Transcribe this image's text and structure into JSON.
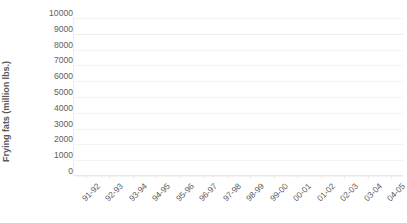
{
  "chart_data": {
    "type": "line",
    "title": "",
    "xlabel": "",
    "ylabel": "Frying fats (million lbs.)",
    "categories": [
      "91-92",
      "92-93",
      "93-94",
      "94-95",
      "95-96",
      "96-97",
      "97-98",
      "98-99",
      "99-00",
      "00-01",
      "01-02",
      "02-03",
      "03-04",
      "04-05"
    ],
    "series": [
      {
        "name": "Frying fats",
        "values": [
          null,
          null,
          null,
          null,
          null,
          null,
          null,
          null,
          null,
          null,
          null,
          null,
          null,
          null
        ]
      }
    ],
    "yticks": [
      10000,
      9000,
      8000,
      7000,
      6000,
      5000,
      4000,
      3000,
      2000,
      1000,
      0
    ],
    "ytick_labels": [
      "10000",
      "9000",
      "8000",
      "7000",
      "6000",
      "5000",
      "4000",
      "3000",
      "2000",
      "1000",
      "0"
    ],
    "ylim": [
      0,
      10000
    ],
    "grid": "faint-horizontal",
    "legend": "none",
    "plot_empty": true,
    "colors": {
      "background": "#ffffff",
      "tick_text": "#5e5e5e",
      "axis_title_text": "#595959",
      "axis_line": "#e8e8e8",
      "gridline": "#f4f4f4"
    }
  }
}
